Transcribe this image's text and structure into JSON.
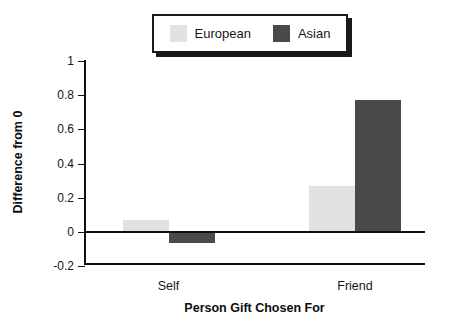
{
  "chart_data": {
    "type": "bar",
    "title": "",
    "xlabel": "Person Gift Chosen For",
    "ylabel": "Difference from 0",
    "categories": [
      "Self",
      "Friend"
    ],
    "series": [
      {
        "name": "European",
        "color": "#e2e2e2",
        "values": [
          0.07,
          0.27
        ]
      },
      {
        "name": "Asian",
        "color": "#4a4a4a",
        "values": [
          -0.065,
          0.77
        ]
      }
    ],
    "ylim": [
      -0.2,
      1
    ],
    "yticks": [
      1,
      0.8,
      0.6,
      0.4,
      0.2,
      0,
      -0.2
    ],
    "ytick_labels": [
      "1",
      "0.8",
      "0.6",
      "0.4",
      "0.2",
      "0",
      "-0.2"
    ],
    "grid": false,
    "legend_position": "top-center",
    "zero_reference_line": true
  },
  "legend": {
    "entries": [
      {
        "label": "European",
        "swatch": "european-swatch"
      },
      {
        "label": "Asian",
        "swatch": "asian-swatch"
      }
    ]
  },
  "axes": {
    "y_title": "Difference from 0",
    "x_title": "Person Gift Chosen For",
    "y_tick_labels": [
      "1",
      "0.8",
      "0.6",
      "0.4",
      "0.2",
      "0",
      "-0.2"
    ],
    "x_tick_labels": [
      "Self",
      "Friend"
    ]
  },
  "colors": {
    "european": "#e2e2e2",
    "asian": "#4a4a4a",
    "axis": "#101010",
    "text": "#151515",
    "background": "#ffffff"
  }
}
